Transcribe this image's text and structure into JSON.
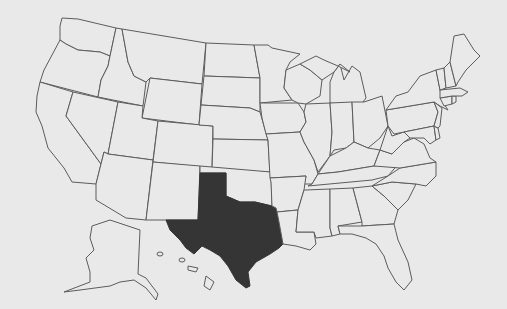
{
  "map": {
    "title": "United States",
    "highlighted_state": "Texas",
    "colors": {
      "background": "#e9e9e9",
      "border": "#5c5c5c",
      "highlight": "#353535"
    },
    "regions": [
      "Washington",
      "Oregon",
      "California",
      "Idaho",
      "Nevada",
      "Montana",
      "Wyoming",
      "Utah",
      "Arizona",
      "Colorado",
      "New Mexico",
      "North Dakota",
      "South Dakota",
      "Nebraska",
      "Kansas",
      "Oklahoma",
      "Texas",
      "Minnesota",
      "Iowa",
      "Missouri",
      "Arkansas",
      "Louisiana",
      "Wisconsin",
      "Illinois",
      "Michigan",
      "Indiana",
      "Ohio",
      "Kentucky",
      "Tennessee",
      "Mississippi",
      "Alabama",
      "Georgia",
      "Florida",
      "South Carolina",
      "North Carolina",
      "Virginia",
      "West Virginia",
      "Pennsylvania",
      "New York",
      "Maryland",
      "Delaware",
      "New Jersey",
      "Connecticut",
      "Rhode Island",
      "Massachusetts",
      "Vermont",
      "New Hampshire",
      "Maine",
      "Alaska",
      "Hawaii"
    ]
  }
}
